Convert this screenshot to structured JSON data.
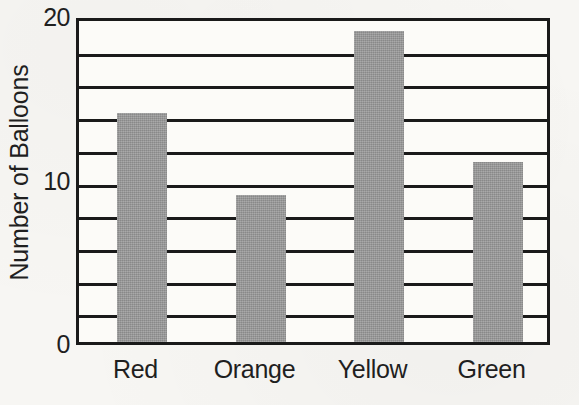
{
  "chart_data": {
    "type": "bar",
    "title": "",
    "xlabel": "",
    "ylabel": "Number of Balloons",
    "categories": [
      "Red",
      "Orange",
      "Yellow",
      "Green"
    ],
    "values": [
      14,
      9,
      19,
      11
    ],
    "ylim": [
      0,
      20
    ],
    "ytick_labels": [
      "0",
      "10",
      "20"
    ],
    "ytick_values": [
      0,
      10,
      20
    ],
    "gridline_values": [
      2,
      4,
      6,
      8,
      10,
      12,
      14,
      16,
      18
    ],
    "grid": "horizontal",
    "legend": "none",
    "bar_color": "#969696",
    "axis_color": "#1a1a1a",
    "background_color": "#f7f6f3"
  }
}
